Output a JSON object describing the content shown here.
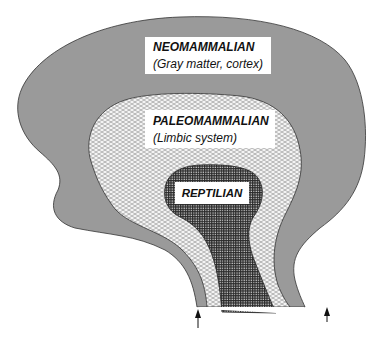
{
  "diagram": {
    "layers": [
      {
        "id": "neomammalian",
        "label": "NEOMAMMALIAN",
        "sublabel": "(Gray matter, cortex)",
        "fill": "#9a9a9a",
        "pattern": "solid-gray"
      },
      {
        "id": "paleomammalian",
        "label": "PALEOMAMMALIAN",
        "sublabel": "(Limbic system)",
        "fill": "#ffffff",
        "pattern": "crosshatch-light"
      },
      {
        "id": "reptilian",
        "label": "REPTILIAN",
        "sublabel": "",
        "fill": "#3a3a3a",
        "pattern": "grid-dark"
      }
    ],
    "arrows": [
      {
        "name": "left-arrow",
        "direction": "up"
      },
      {
        "name": "right-arrow",
        "direction": "up"
      }
    ],
    "colors": {
      "outline": "#333333",
      "background": "#ffffff"
    }
  }
}
